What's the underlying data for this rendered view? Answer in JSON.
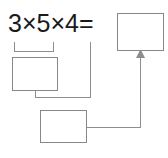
{
  "worksheet": {
    "equation": "3×5×4=",
    "operands": [
      3,
      5,
      4
    ],
    "operator_symbol": "×",
    "equals_symbol": "=",
    "answer_boxes": [
      {
        "name": "product-3x5",
        "value": "",
        "placeholder": ""
      },
      {
        "name": "partial-product",
        "value": "",
        "placeholder": ""
      },
      {
        "name": "final-result",
        "value": "",
        "placeholder": ""
      }
    ],
    "colors": {
      "text": "#1a1a1a",
      "box_border": "#888888",
      "connector": "#8d8d8d",
      "background": "#ffffff"
    },
    "connectors": [
      {
        "name": "brace-3x5",
        "from": "3×5",
        "to": "product-3x5"
      },
      {
        "name": "branch-4",
        "from": "4",
        "to": "partial-product"
      },
      {
        "name": "branch-product-3x5",
        "from": "product-3x5",
        "to": "partial-product"
      },
      {
        "name": "arrow-to-result",
        "from": "partial-product",
        "to": "final-result",
        "arrowhead": true
      }
    ]
  }
}
